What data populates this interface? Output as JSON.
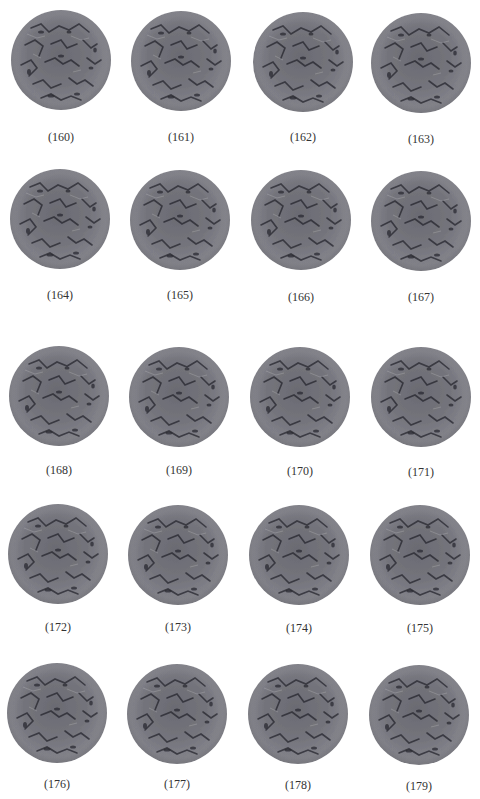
{
  "figure": {
    "panels": [
      {
        "label": "(160)",
        "cx": 61,
        "cy": 60,
        "ly": 130
      },
      {
        "label": "(161)",
        "cx": 181,
        "cy": 61,
        "ly": 130
      },
      {
        "label": "(162)",
        "cx": 303,
        "cy": 62,
        "ly": 130
      },
      {
        "label": "(163)",
        "cx": 421,
        "cy": 63,
        "ly": 132
      },
      {
        "label": "(164)",
        "cx": 60,
        "cy": 219,
        "ly": 288
      },
      {
        "label": "(165)",
        "cx": 180,
        "cy": 220,
        "ly": 288
      },
      {
        "label": "(166)",
        "cx": 301,
        "cy": 220,
        "ly": 290
      },
      {
        "label": "(167)",
        "cx": 421,
        "cy": 221,
        "ly": 290
      },
      {
        "label": "(168)",
        "cx": 59,
        "cy": 396,
        "ly": 463
      },
      {
        "label": "(169)",
        "cx": 179,
        "cy": 397,
        "ly": 463
      },
      {
        "label": "(170)",
        "cx": 300,
        "cy": 397,
        "ly": 464
      },
      {
        "label": "(171)",
        "cx": 421,
        "cy": 397,
        "ly": 465
      },
      {
        "label": "(172)",
        "cx": 58,
        "cy": 554,
        "ly": 620
      },
      {
        "label": "(173)",
        "cx": 178,
        "cy": 555,
        "ly": 620
      },
      {
        "label": "(174)",
        "cx": 299,
        "cy": 555,
        "ly": 621
      },
      {
        "label": "(175)",
        "cx": 420,
        "cy": 555,
        "ly": 621
      },
      {
        "label": "(176)",
        "cx": 57,
        "cy": 713,
        "ly": 777
      },
      {
        "label": "(177)",
        "cx": 177,
        "cy": 714,
        "ly": 777
      },
      {
        "label": "(178)",
        "cx": 298,
        "cy": 714,
        "ly": 778
      },
      {
        "label": "(179)",
        "cx": 419,
        "cy": 715,
        "ly": 779
      }
    ]
  }
}
